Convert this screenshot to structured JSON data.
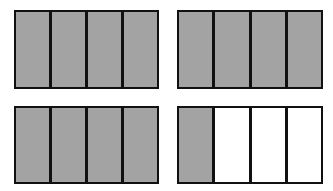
{
  "figure": {
    "colors": {
      "shaded": "#a3a3a3",
      "empty": "#ffffff",
      "border": "#111111"
    },
    "models": [
      {
        "parts": 4,
        "shaded": 4
      },
      {
        "parts": 4,
        "shaded": 4
      },
      {
        "parts": 4,
        "shaded": 4
      },
      {
        "parts": 4,
        "shaded": 1
      }
    ]
  }
}
